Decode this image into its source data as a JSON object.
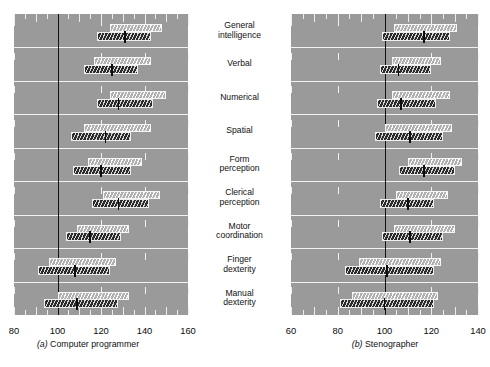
{
  "figure": {
    "categories": [
      "General\nintelligence",
      "Verbal",
      "Numerical",
      "Spatial",
      "Form\nperception",
      "Clerical\nperception",
      "Motor\ncoordination",
      "Finger\ndexterity",
      "Manual\ndexterity"
    ],
    "reference_value": 100,
    "colors": {
      "panel_background": "#9a9a9a",
      "page_background": "#ffffff",
      "reference_line": "#111111",
      "light_bar": "#c8c8c8",
      "dark_bar": "#3a3a3a",
      "gridline": "#f2f2f2",
      "text": "#101010"
    }
  },
  "chart_data": [
    {
      "type": "bar",
      "title": "(a)  Computer programmer",
      "caption_letter": "(a)",
      "caption_text": "Computer programmer",
      "xlabel": "",
      "ylabel": "",
      "xlim": [
        80,
        160
      ],
      "xticks": [
        80,
        100,
        120,
        140,
        160
      ],
      "xticklabels": [
        "80",
        "100",
        "120",
        "140",
        "160"
      ],
      "minor_tick_step": 5,
      "grid": true,
      "legend": "none",
      "reference_line": 100,
      "categories": [
        "General intelligence",
        "Verbal",
        "Numerical",
        "Spatial",
        "Form perception",
        "Clerical perception",
        "Motor coordination",
        "Finger dexterity",
        "Manual dexterity"
      ],
      "series": [
        {
          "name": "Outer range (light hatched)",
          "ranges": [
            [
              124,
              148
            ],
            [
              117,
              143
            ],
            [
              124,
              150
            ],
            [
              112,
              143
            ],
            [
              114,
              139
            ],
            [
              121,
              147
            ],
            [
              109,
              133
            ],
            [
              96,
              127
            ],
            [
              100,
              133
            ]
          ]
        },
        {
          "name": "Inner range (dark hatched)",
          "ranges": [
            [
              118,
              143
            ],
            [
              112,
              137
            ],
            [
              118,
              144
            ],
            [
              106,
              134
            ],
            [
              107,
              134
            ],
            [
              116,
              142
            ],
            [
              104,
              129
            ],
            [
              91,
              124
            ],
            [
              94,
              128
            ]
          ]
        }
      ],
      "medians": [
        131,
        125,
        128,
        122,
        120,
        128,
        115,
        108,
        109
      ]
    },
    {
      "type": "bar",
      "title": "(b)  Stenographer",
      "caption_letter": "(b)",
      "caption_text": "Stenographer",
      "xlabel": "",
      "ylabel": "",
      "xlim": [
        60,
        140
      ],
      "xticks": [
        60,
        80,
        100,
        120,
        140
      ],
      "xticklabels": [
        "60",
        "80",
        "100",
        "120",
        "140"
      ],
      "minor_tick_step": 5,
      "grid": true,
      "legend": "none",
      "reference_line": 100,
      "categories": [
        "General intelligence",
        "Verbal",
        "Numerical",
        "Spatial",
        "Form perception",
        "Clerical perception",
        "Motor coordination",
        "Finger dexterity",
        "Manual dexterity"
      ],
      "series": [
        {
          "name": "Outer range (light hatched)",
          "ranges": [
            [
              104,
              131
            ],
            [
              103,
              124
            ],
            [
              103,
              128
            ],
            [
              100,
              129
            ],
            [
              110,
              133
            ],
            [
              105,
              127
            ],
            [
              104,
              130
            ],
            [
              89,
              124
            ],
            [
              86,
              123
            ]
          ]
        },
        {
          "name": "Inner range (dark hatched)",
          "ranges": [
            [
              99,
              128
            ],
            [
              98,
              120
            ],
            [
              97,
              122
            ],
            [
              96,
              125
            ],
            [
              106,
              130
            ],
            [
              98,
              121
            ],
            [
              99,
              125
            ],
            [
              83,
              121
            ],
            [
              81,
              121
            ]
          ]
        }
      ],
      "medians": [
        117,
        106,
        107,
        111,
        117,
        110,
        111,
        101,
        100
      ]
    }
  ]
}
